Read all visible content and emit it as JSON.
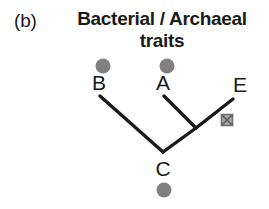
{
  "figure": {
    "panel_label": "(b)",
    "title": "Bacterial / Archaeal traits",
    "title_line1": "Bacterial / Archaeal",
    "title_line2": "traits"
  },
  "colors": {
    "branch": "#1a1a1a",
    "text": "#1a1a1a",
    "circle_marker": "#808080",
    "square_marker_fill": "#9a9a9a",
    "square_marker_stroke": "#6e6e6e",
    "background": "#ffffff"
  },
  "tree": {
    "type": "cladogram",
    "taxa": [
      {
        "id": "B",
        "label": "B",
        "label_x": 99,
        "label_y": 73,
        "tip_x": 100,
        "tip_y": 96,
        "marker": "circle",
        "marker_x": 103,
        "marker_y": 66,
        "marker_position": "above-label"
      },
      {
        "id": "A",
        "label": "A",
        "label_x": 163,
        "label_y": 73,
        "tip_x": 164,
        "tip_y": 96,
        "marker": "circle",
        "marker_x": 167,
        "marker_y": 66,
        "marker_position": "above-label"
      },
      {
        "id": "E",
        "label": "E",
        "label_x": 240,
        "label_y": 76,
        "tip_x": 233,
        "tip_y": 99,
        "marker": "none",
        "marker_position": "none"
      },
      {
        "id": "C",
        "label": "C",
        "label_x": 163,
        "label_y": 157,
        "tip_x": 163,
        "tip_y": 152,
        "marker": "circle",
        "marker_x": 164,
        "marker_y": 190,
        "marker_position": "below-label"
      }
    ],
    "internal_nodes": [
      {
        "id": "root",
        "x": 163,
        "y": 152
      },
      {
        "id": "AE-ancestor",
        "x": 196,
        "y": 128
      }
    ],
    "branches": [
      {
        "from": "B",
        "to": "root",
        "x1": 100,
        "y1": 96,
        "x2": 163,
        "y2": 152
      },
      {
        "from": "root",
        "to": "AE-ancestor",
        "x1": 163,
        "y1": 152,
        "x2": 196,
        "y2": 128
      },
      {
        "from": "A",
        "to": "AE-ancestor",
        "x1": 164,
        "y1": 96,
        "x2": 196,
        "y2": 128
      },
      {
        "from": "E",
        "to": "AE-ancestor",
        "x1": 233,
        "y1": 99,
        "x2": 196,
        "y2": 128
      }
    ],
    "trait_markers": [
      {
        "id": "trait-loss-marker",
        "shape": "crossed-square",
        "x": 227,
        "y": 120,
        "size": 11,
        "on_branch": "E"
      }
    ],
    "line_width": 3,
    "circle_radius": 7.5
  }
}
